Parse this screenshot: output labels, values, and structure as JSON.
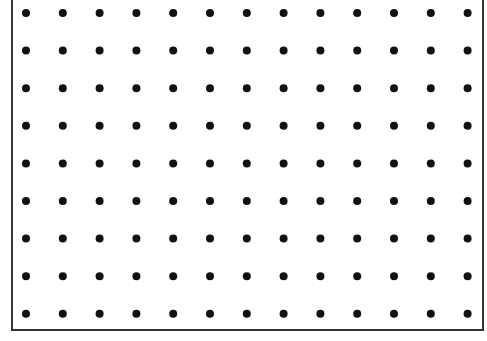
{
  "diagram": {
    "type": "dot-grid",
    "columns": 13,
    "rows": 9,
    "origin_x": 26,
    "origin_y": 13,
    "spacing_x": 36.8,
    "spacing_y": 37.6,
    "dot_radius": 4,
    "dot_color": "#111111",
    "border_color": "#333333"
  }
}
